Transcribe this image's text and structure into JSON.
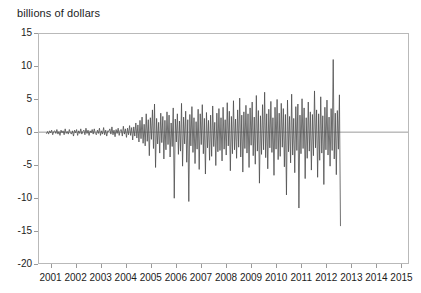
{
  "chart_data": {
    "type": "line",
    "title": "billions of dollars",
    "xlabel": "",
    "ylabel": "billions of dollars",
    "ylim": [
      -20,
      15
    ],
    "xlim": [
      2000.5,
      2015.3
    ],
    "grid": false,
    "legend": null,
    "yticks": [
      15,
      10,
      5,
      0,
      -5,
      -10,
      -15,
      -20
    ],
    "ytick_labels": [
      "15",
      "10",
      "5",
      "0",
      "-5",
      "-10",
      "-15",
      "-20"
    ],
    "xticks": [
      2001,
      2002,
      2003,
      2004,
      2005,
      2006,
      2007,
      2008,
      2009,
      2010,
      2011,
      2012,
      2013,
      2014,
      2015
    ],
    "xtick_labels": [
      "2001",
      "2002",
      "2003",
      "2004",
      "2005",
      "2006",
      "2007",
      "2008",
      "2009",
      "2010",
      "2011",
      "2012",
      "2013",
      "2014",
      "2015"
    ],
    "line_color": "#4d4d4d",
    "zero_line_color": "#9a9a9a",
    "frame_color": "#b9b9b9",
    "series": [
      {
        "name": "net flow",
        "x_start": 2000.8,
        "x_step": 0.0416666,
        "values": [
          -0.2,
          0.1,
          -0.3,
          0.2,
          -0.1,
          0.3,
          -0.4,
          0.1,
          0.2,
          -0.2,
          0.4,
          -0.3,
          0.1,
          -0.5,
          0.3,
          -0.1,
          0.2,
          -0.4,
          0.5,
          -0.2,
          0.1,
          -0.3,
          0.4,
          -0.1,
          -0.3,
          0.2,
          -0.6,
          0.3,
          -0.1,
          0.4,
          -0.5,
          0.2,
          -0.2,
          0.5,
          -0.3,
          0.1,
          0.3,
          -0.4,
          0.6,
          -0.2,
          0.3,
          -0.5,
          0.2,
          -0.1,
          0.4,
          -0.3,
          0.5,
          -0.2,
          -0.4,
          0.3,
          -0.2,
          0.6,
          -0.5,
          0.2,
          -0.3,
          0.7,
          -0.4,
          0.3,
          -0.6,
          0.2,
          0.1,
          0.5,
          -0.3,
          0.8,
          -0.4,
          0.3,
          -0.7,
          0.4,
          -0.2,
          0.6,
          -0.5,
          0.3,
          0.4,
          -0.6,
          0.9,
          -0.3,
          0.5,
          -0.8,
          0.6,
          -0.4,
          1.0,
          -0.5,
          0.7,
          -1.2,
          0.8,
          -0.6,
          1.4,
          -0.9,
          1.1,
          -1.5,
          1.8,
          -1.0,
          2.3,
          -1.7,
          1.2,
          -2.1,
          2.8,
          -1.4,
          1.9,
          -3.6,
          2.2,
          -1.1,
          3.4,
          -2.5,
          4.3,
          -5.4,
          2.1,
          -1.8,
          1.5,
          -3.2,
          2.9,
          -1.6,
          2.4,
          -4.1,
          1.8,
          -2.7,
          3.1,
          -1.9,
          2.6,
          -3.8,
          1.4,
          -2.2,
          3.7,
          -10.1,
          2.0,
          -1.5,
          2.8,
          -3.4,
          1.7,
          -2.9,
          4.4,
          -5.2,
          2.3,
          -1.8,
          3.2,
          -4.6,
          1.9,
          -10.6,
          2.7,
          -2.1,
          3.9,
          -3.1,
          2.2,
          -4.8,
          1.6,
          -2.6,
          3.5,
          -5.7,
          2.8,
          -1.9,
          4.2,
          -3.3,
          2.1,
          -6.4,
          3.0,
          -2.4,
          1.8,
          -4.3,
          2.6,
          -3.7,
          4.0,
          -2.2,
          1.5,
          -5.1,
          2.9,
          -3.0,
          3.6,
          -2.8,
          2.2,
          -4.4,
          3.8,
          -2.6,
          1.9,
          -3.5,
          4.5,
          -2.1,
          3.2,
          -5.9,
          2.4,
          -3.3,
          4.8,
          -2.7,
          2.0,
          -4.0,
          3.4,
          -2.3,
          5.2,
          -3.8,
          2.6,
          -6.1,
          3.1,
          -2.5,
          4.1,
          -3.2,
          2.8,
          -5.4,
          3.7,
          -2.0,
          4.6,
          -3.6,
          2.3,
          -4.9,
          5.6,
          -2.9,
          3.3,
          -7.8,
          2.5,
          -3.4,
          4.2,
          -2.7,
          6.1,
          -3.9,
          2.8,
          -5.6,
          3.5,
          -2.4,
          4.7,
          -3.1,
          2.2,
          -6.6,
          3.8,
          -2.6,
          5.0,
          -4.2,
          2.9,
          -3.7,
          4.4,
          -2.3,
          3.6,
          -5.3,
          2.7,
          -9.6,
          4.9,
          -3.0,
          2.4,
          -4.7,
          5.8,
          -3.5,
          2.1,
          -6.2,
          3.9,
          -2.8,
          4.3,
          -11.6,
          2.6,
          -3.3,
          5.1,
          -2.5,
          3.7,
          -7.1,
          2.2,
          -4.0,
          4.6,
          -2.9,
          3.1,
          -5.8,
          2.7,
          -3.6,
          6.3,
          -2.4,
          3.4,
          -6.9,
          2.8,
          -4.3,
          5.4,
          -3.2,
          2.5,
          -8.0,
          3.8,
          -2.7,
          4.9,
          -3.5,
          2.3,
          -5.2,
          3.6,
          -2.8,
          11.1,
          -4.1,
          2.9,
          -6.5,
          3.3,
          -2.6,
          5.7,
          -14.3
        ]
      }
    ],
    "annotations": []
  },
  "figure": {
    "title_text": "billions of dollars"
  }
}
